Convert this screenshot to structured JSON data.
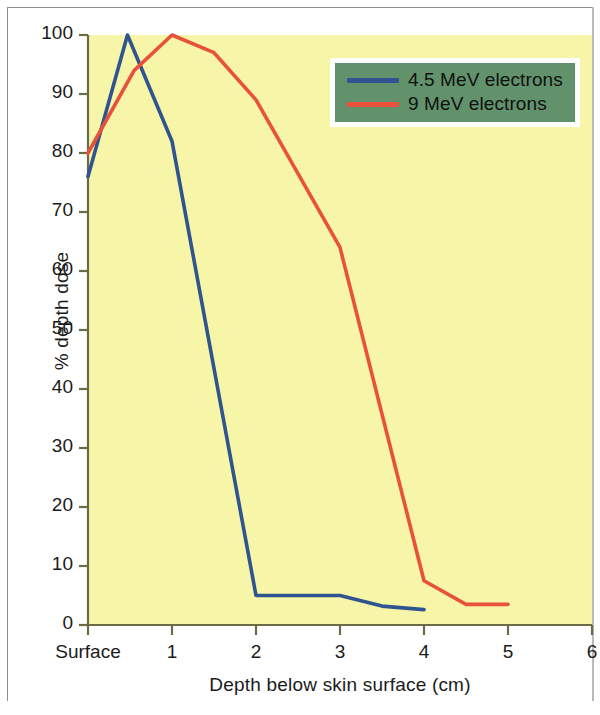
{
  "chart_data": {
    "type": "line",
    "title": "",
    "xlabel": "Depth below skin surface (cm)",
    "ylabel": "% depth dose",
    "xlim": [
      0,
      6
    ],
    "ylim": [
      0,
      100
    ],
    "grid": false,
    "legend_position": "top-right",
    "xticks": [
      {
        "value": 0,
        "label": "Surface"
      },
      {
        "value": 1,
        "label": "1"
      },
      {
        "value": 2,
        "label": "2"
      },
      {
        "value": 3,
        "label": "3"
      },
      {
        "value": 4,
        "label": "4"
      },
      {
        "value": 5,
        "label": "5"
      },
      {
        "value": 6,
        "label": "6"
      }
    ],
    "yticks": [
      {
        "value": 0,
        "label": "0"
      },
      {
        "value": 10,
        "label": "10"
      },
      {
        "value": 20,
        "label": "20"
      },
      {
        "value": 30,
        "label": "30"
      },
      {
        "value": 40,
        "label": "40"
      },
      {
        "value": 50,
        "label": "50"
      },
      {
        "value": 60,
        "label": "60"
      },
      {
        "value": 70,
        "label": "70"
      },
      {
        "value": 80,
        "label": "80"
      },
      {
        "value": 90,
        "label": "90"
      },
      {
        "value": 100,
        "label": "100"
      }
    ],
    "series": [
      {
        "name": "4.5 MeV electrons",
        "color": "#2f5490",
        "points": [
          [
            0.0,
            76.0
          ],
          [
            0.47,
            100.0
          ],
          [
            1.0,
            82.0
          ],
          [
            2.0,
            5.0
          ],
          [
            3.0,
            5.0
          ],
          [
            3.5,
            3.2
          ],
          [
            4.0,
            2.6
          ]
        ]
      },
      {
        "name": "9 MeV electrons",
        "color": "#e8513b",
        "points": [
          [
            0.0,
            80.0
          ],
          [
            0.55,
            94.0
          ],
          [
            1.0,
            100.0
          ],
          [
            1.5,
            97.0
          ],
          [
            2.0,
            89.0
          ],
          [
            3.0,
            64.0
          ],
          [
            4.0,
            7.5
          ],
          [
            4.5,
            3.5
          ],
          [
            5.0,
            3.5
          ]
        ]
      }
    ]
  },
  "legend": {
    "entries": [
      {
        "label": "4.5 MeV electrons",
        "color": "#2f5490"
      },
      {
        "label": "9 MeV electrons",
        "color": "#e8513b"
      }
    ],
    "background_color": "#61926c",
    "border_color": "#ffffff"
  },
  "style": {
    "plot_background": "#f7f5a8",
    "axis_color": "#6b6b46",
    "text_color": "#1b1b1b",
    "figure_background": "#ffffff",
    "frame_color": "#8e8e8e"
  }
}
